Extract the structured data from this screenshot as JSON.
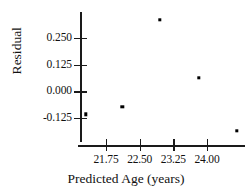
{
  "chart_data": {
    "type": "scatter",
    "title": "",
    "xlabel": "Predicted Age (years)",
    "ylabel": "Residual",
    "xlim": [
      20.7,
      25.0
    ],
    "ylim": [
      -0.235,
      0.36
    ],
    "grid": false,
    "legend": null,
    "xticks": [
      21.75,
      22.5,
      23.25,
      24.0
    ],
    "xtick_labels": [
      "21.75",
      "22.50",
      "23.25",
      "24.00"
    ],
    "yticks": [
      0.25,
      0.125,
      0.0,
      -0.125
    ],
    "ytick_labels": [
      "0.250",
      "0.125",
      "0.000",
      "-0.125"
    ],
    "marker_color": "#000000",
    "axis_color": "#1a1a1a",
    "points": [
      {
        "x": 21.3,
        "y": -0.107
      },
      {
        "x": 22.11,
        "y": -0.074
      },
      {
        "x": 22.95,
        "y": 0.334
      },
      {
        "x": 23.82,
        "y": 0.062
      },
      {
        "x": 24.66,
        "y": -0.186
      }
    ]
  }
}
